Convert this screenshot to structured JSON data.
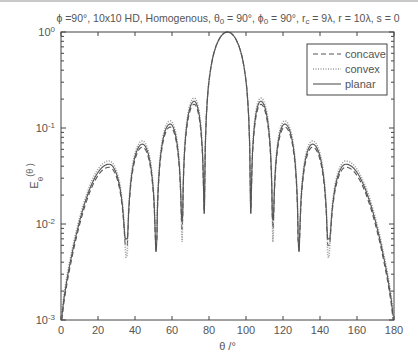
{
  "chart_data": {
    "type": "line",
    "title": "ϕ =90°, 10x10 HD, Homogenous, θ0 = 90°, ϕ0 = 90°, rc = 9λ, r = 10λ, s = 0",
    "title_parts": {
      "phi": "ϕ =90°, 10x10 HD, Homogenous, θ",
      "sub0": "0",
      "mid1": " = 90°, ϕ",
      "sub1": "0",
      "mid2": " = 90°, r",
      "sub2": "c",
      "tail": " = 9λ, r = 10λ, s = 0"
    },
    "xlabel": "θ /°",
    "ylabel": "E",
    "ylabel_sub": "θ",
    "ylabel_tail": "(θ )",
    "xlim": [
      0,
      180
    ],
    "ylim": [
      0.001,
      1
    ],
    "yscale": "log",
    "xticks": [
      0,
      20,
      40,
      60,
      80,
      100,
      120,
      140,
      160,
      180
    ],
    "yticks": [
      {
        "base": "10",
        "exp": "0",
        "value": 1
      },
      {
        "base": "10",
        "exp": "-1",
        "value": 0.1
      },
      {
        "base": "10",
        "exp": "-2",
        "value": 0.01
      },
      {
        "base": "10",
        "exp": "-3",
        "value": 0.001
      }
    ],
    "grid": false,
    "legend_position": "upper right",
    "legend": [
      {
        "label": "concave",
        "style": "dashed"
      },
      {
        "label": "convex",
        "style": "dotted"
      },
      {
        "label": "planar",
        "style": "solid"
      }
    ],
    "lobes": [
      {
        "theta": 26,
        "peak": 0.042
      },
      {
        "theta": 44,
        "peak": 0.068
      },
      {
        "theta": 59,
        "peak": 0.11
      },
      {
        "theta": 72,
        "peak": 0.19
      },
      {
        "theta": 90,
        "peak": 1.0
      },
      {
        "theta": 108,
        "peak": 0.19
      },
      {
        "theta": 121,
        "peak": 0.11
      },
      {
        "theta": 136,
        "peak": 0.068
      },
      {
        "theta": 154,
        "peak": 0.042
      }
    ],
    "nulls": [
      {
        "theta": 35.5,
        "planar": 0.007,
        "convex": 0.0045,
        "concave": 0.006
      },
      {
        "theta": 51.5,
        "planar": 0.0052,
        "convex": 0.009,
        "concave": 0.006
      },
      {
        "theta": 65.5,
        "planar": 0.011,
        "convex": 0.0065,
        "concave": 0.009
      },
      {
        "theta": 77.5,
        "planar": 0.013,
        "convex": 0.016,
        "concave": 0.014
      },
      {
        "theta": 102.5,
        "planar": 0.013,
        "convex": 0.016,
        "concave": 0.014
      },
      {
        "theta": 114.5,
        "planar": 0.011,
        "convex": 0.0065,
        "concave": 0.009
      },
      {
        "theta": 128.5,
        "planar": 0.0052,
        "convex": 0.009,
        "concave": 0.006
      },
      {
        "theta": 144.5,
        "planar": 0.007,
        "convex": 0.0045,
        "concave": 0.006
      }
    ],
    "series": [
      {
        "name": "concave",
        "style": "dashed",
        "endpoints": {
          "theta0": 0.001,
          "theta180": 0.001
        },
        "lobe_scale": 0.93
      },
      {
        "name": "convex",
        "style": "dotted",
        "endpoints": {
          "theta0": 0.0012,
          "theta180": 0.0012
        },
        "lobe_scale": 1.08
      },
      {
        "name": "planar",
        "style": "solid",
        "endpoints": {
          "theta0": 0.0011,
          "theta180": 0.0011
        },
        "lobe_scale": 1.0
      }
    ],
    "colors": {
      "line": "#555555",
      "axis": "#444444",
      "text": "#555555"
    }
  }
}
